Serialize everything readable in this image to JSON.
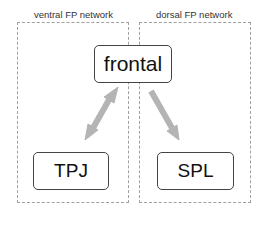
{
  "diagram": {
    "regions": [
      {
        "id": "ventral",
        "label": "ventral FP network"
      },
      {
        "id": "dorsal",
        "label": "dorsal FP network"
      }
    ],
    "nodes": [
      {
        "id": "frontal",
        "label": "frontal"
      },
      {
        "id": "tpj",
        "label": "TPJ"
      },
      {
        "id": "spl",
        "label": "SPL"
      }
    ],
    "edges": [
      {
        "from": "frontal",
        "to": "tpj",
        "direction": "bidirectional",
        "region": "ventral"
      },
      {
        "from": "frontal",
        "to": "spl",
        "direction": "forward",
        "region": "dorsal"
      }
    ],
    "colors": {
      "arrow": "#b4b4b4",
      "node_border": "#444444",
      "region_border": "#a0a0a0"
    }
  }
}
